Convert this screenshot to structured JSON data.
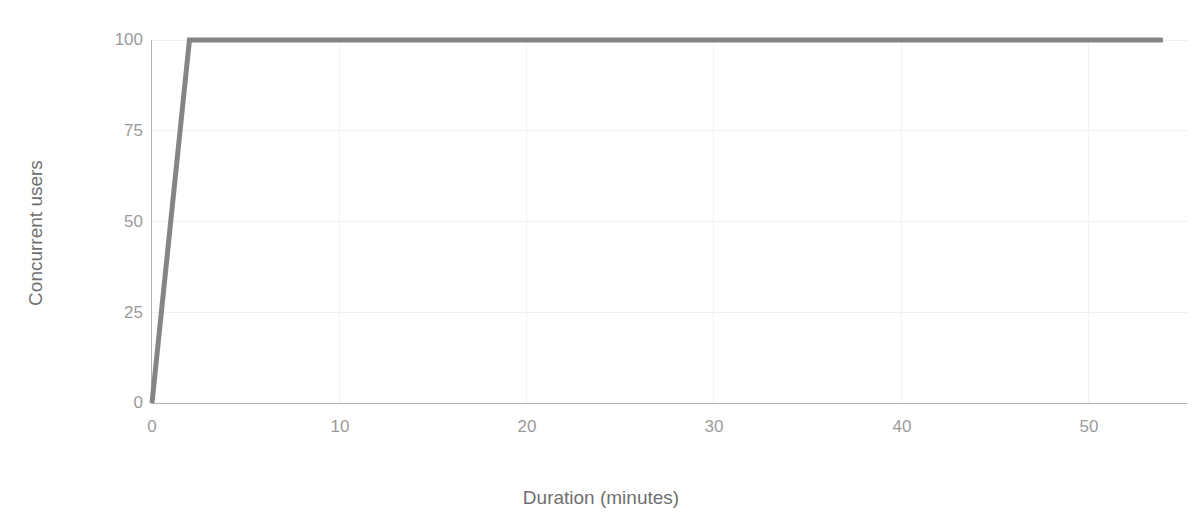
{
  "chart_data": {
    "type": "line",
    "title": "",
    "subtitle": "",
    "xlabel": "Duration (minutes)",
    "ylabel": "Concurrent users",
    "xlim": [
      0,
      54
    ],
    "ylim": [
      0,
      100
    ],
    "xticks": [
      0,
      10,
      20,
      30,
      40,
      50
    ],
    "xtick_labels": [
      "0",
      "10",
      "20",
      "30",
      "40",
      "50"
    ],
    "yticks": [
      0,
      25,
      50,
      75,
      100
    ],
    "ytick_labels": [
      "0",
      "25",
      "50",
      "75",
      "100"
    ],
    "grid": true,
    "legend": "none",
    "series": [
      {
        "name": "Concurrent users",
        "color": "#858585",
        "line_width": 5,
        "x": [
          0,
          2,
          54
        ],
        "values": [
          0,
          100,
          100
        ]
      }
    ],
    "annotations": []
  },
  "colors": {
    "line": "#858585",
    "axis": "#b3b3b3",
    "gridline": "#f1f1f1",
    "tick_text": "#9b9b9b",
    "axis_title_text": "#6f6f6f",
    "background": "#ffffff"
  }
}
